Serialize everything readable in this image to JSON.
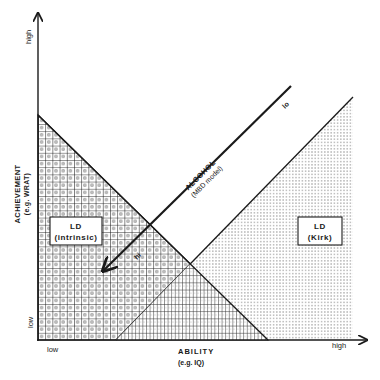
{
  "diagram": {
    "y_axis": {
      "title": "ACHIEVEMENT",
      "subtitle": "(e.g. WRAT)",
      "high_label": "high",
      "low_label": "low"
    },
    "x_axis": {
      "title": "ABILITY",
      "subtitle": "(e.g. IQ)",
      "low_label": "low",
      "high_label": "high"
    },
    "regions": [
      {
        "id": "ld-intrinsic",
        "title": "LD",
        "subtitle": "(intrinsic)",
        "pattern": "grid-with-dots"
      },
      {
        "id": "ld-kirk",
        "title": "LD",
        "subtitle": "(Kirk)",
        "pattern": "dotted"
      }
    ],
    "alcohol_arrow": {
      "title": "ALCOHOL",
      "subtitle": "(MBD model)",
      "start_label": "lo",
      "end_label": "hi"
    },
    "colors": {
      "ink": "#1a1a1a",
      "background": "#ffffff"
    }
  }
}
